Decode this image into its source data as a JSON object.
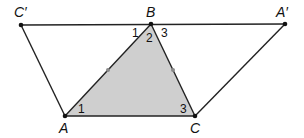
{
  "diagram": {
    "colors": {
      "stroke": "#222222",
      "fill": "#cfcfcf",
      "tick": "#888888",
      "background": "#ffffff"
    },
    "points": {
      "C_prime": {
        "label": "C′",
        "x": 21,
        "y": 25
      },
      "B": {
        "label": "B",
        "x": 151,
        "y": 24
      },
      "A_prime": {
        "label": "A′",
        "x": 285,
        "y": 24
      },
      "A": {
        "label": "A",
        "x": 65,
        "y": 116
      },
      "C": {
        "label": "C",
        "x": 195,
        "y": 116
      }
    },
    "shaded_triangle": [
      "A",
      "B",
      "C"
    ],
    "segments": [
      [
        "C_prime",
        "A_prime"
      ],
      [
        "C_prime",
        "A"
      ],
      [
        "A",
        "C"
      ],
      [
        "C",
        "A_prime"
      ],
      [
        "A",
        "B"
      ],
      [
        "B",
        "C"
      ]
    ],
    "angle_labels": {
      "B1": "1",
      "B2": "2",
      "B3": "3",
      "A1": "1",
      "C3": "3"
    },
    "midpoint_ticks": [
      "AB",
      "BC"
    ]
  }
}
